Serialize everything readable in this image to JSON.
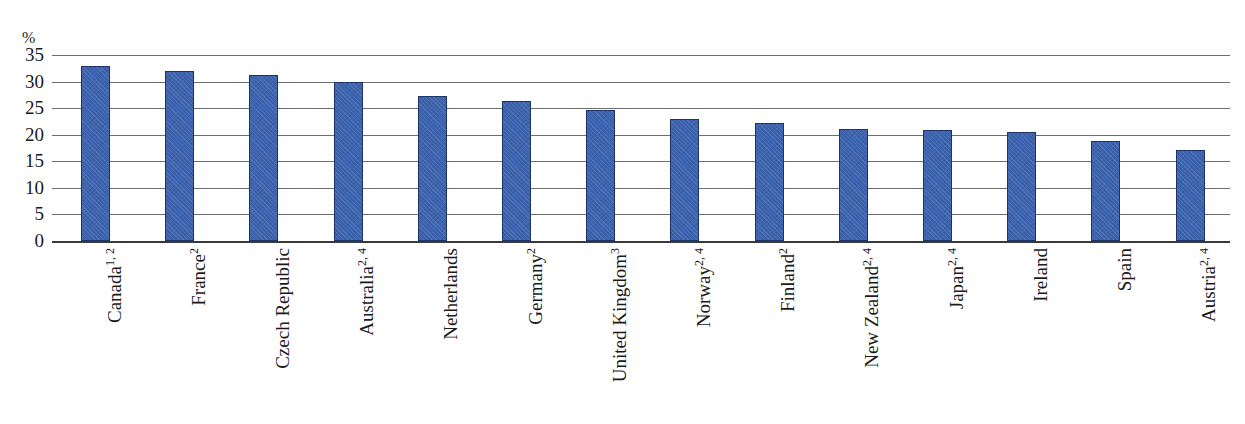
{
  "chart_data": {
    "type": "bar",
    "title": "",
    "xlabel": "",
    "ylabel": "%",
    "unit_label": "%",
    "ylim": [
      0,
      35
    ],
    "ytick_step": 5,
    "grid": true,
    "legend": "none",
    "bar_color": "#3c63b0",
    "bar_border_color": "#1b3366",
    "gridline_color": "#6d6d6d",
    "axis_color": "#3a3a3a",
    "ytick_labels": [
      "35",
      "30",
      "25",
      "20",
      "15",
      "10",
      "5",
      "0"
    ],
    "ytick_values": [
      35,
      30,
      25,
      20,
      15,
      10,
      5,
      0
    ],
    "categories": [
      "Canada",
      "France",
      "Czech Republic",
      "Australia",
      "Netherlands",
      "Germany",
      "United Kingdom",
      "Norway",
      "Finland",
      "New Zealand",
      "Japan",
      "Ireland",
      "Spain",
      "Austria"
    ],
    "category_footnotes": [
      "1, 2",
      "2",
      "",
      "2, 4",
      "",
      "2",
      "3",
      "2, 4",
      "2",
      "2, 4",
      "2, 4",
      "",
      "",
      "2, 4"
    ],
    "values": [
      33.0,
      32.0,
      31.3,
      30.0,
      27.2,
      26.3,
      24.7,
      22.9,
      22.3,
      21.0,
      20.8,
      20.5,
      18.8,
      17.1
    ]
  }
}
